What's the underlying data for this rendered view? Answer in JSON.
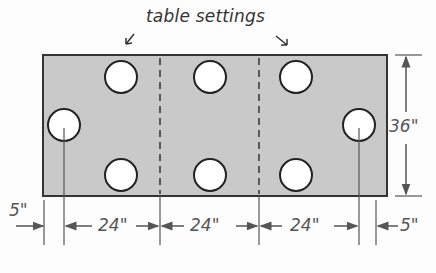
{
  "diagram": {
    "title": "table settings",
    "table": {
      "fill_color": "#c9c9c9",
      "border_color": "#333333",
      "width_segments": [
        "5\"",
        "24\"",
        "24\"",
        "24\"",
        "5\""
      ],
      "height": "36\"",
      "sections": 3,
      "place_settings": 8
    },
    "dimensions": {
      "left_end": "5\"",
      "seg1": "24\"",
      "seg2": "24\"",
      "seg3": "24\"",
      "right_end": "5\"",
      "height": "36\""
    }
  }
}
